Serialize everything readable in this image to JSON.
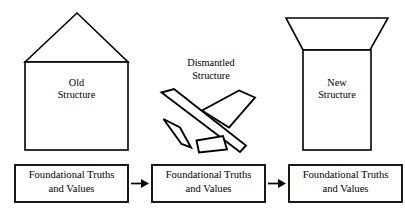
{
  "diagram": {
    "stroke_color": "#000000",
    "fill_color": "#ffffff",
    "background_color": "#ffffff"
  },
  "stages": [
    {
      "id": "old",
      "shape": "house-with-peaked-roof",
      "label_line1": "Old",
      "label_line2": "Structure"
    },
    {
      "id": "dismantled",
      "shape": "scattered-debris-pieces",
      "label_line1": "Dismantled",
      "label_line2": "Structure",
      "piece_count": 4
    },
    {
      "id": "new",
      "shape": "building-with-inverted-trapezoid-roof",
      "label_line1": "New",
      "label_line2": "Structure"
    }
  ],
  "foundations": [
    {
      "id": "foundation-left",
      "line1": "Foundational Truths",
      "line2": "and Values"
    },
    {
      "id": "foundation-middle",
      "line1": "Foundational Truths",
      "line2": "and Values"
    },
    {
      "id": "foundation-right",
      "line1": "Foundational Truths",
      "line2": "and Values"
    }
  ],
  "arrows": [
    {
      "id": "arrow-left-to-middle",
      "icon": "arrow-right-icon"
    },
    {
      "id": "arrow-middle-to-right",
      "icon": "arrow-right-icon"
    }
  ]
}
